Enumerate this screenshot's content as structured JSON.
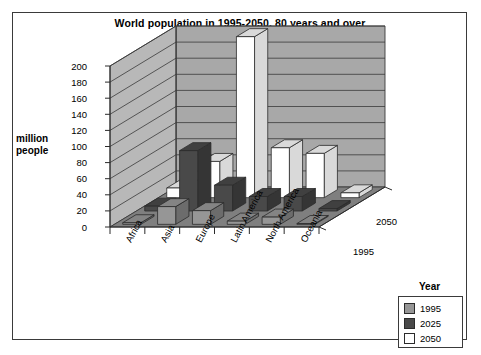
{
  "chart_data": {
    "type": "bar",
    "subtype": "3d-grouped-bar",
    "title": "World population in 1995-2050, 80 years and over",
    "xlabel": "",
    "ylabel": "million people",
    "zlabel": "Year",
    "categories": [
      "Africa",
      "Asia",
      "Europe",
      "Latin America",
      "North America",
      "Oceania"
    ],
    "series": [
      {
        "name": "1995",
        "color": "#969696",
        "values": [
          2,
          22,
          17,
          4,
          9,
          1
        ]
      },
      {
        "name": "2025",
        "color": "#494949",
        "values": [
          6,
          75,
          32,
          18,
          18,
          3
        ]
      },
      {
        "name": "2050",
        "color": "#ffffff",
        "values": [
          12,
          45,
          200,
          62,
          55,
          6
        ]
      }
    ],
    "yticks": [
      0,
      20,
      40,
      60,
      80,
      100,
      120,
      140,
      160,
      180,
      200
    ],
    "ylim": [
      0,
      200
    ],
    "ztick_labels": [
      "1995",
      "2050"
    ],
    "grid": true,
    "legend_position": "bottom-right",
    "legend_title": "Year"
  },
  "legend": {
    "title": "Year",
    "items": [
      {
        "label": "1995",
        "color": "#969696"
      },
      {
        "label": "2025",
        "color": "#494949"
      },
      {
        "label": "2050",
        "color": "#ffffff"
      }
    ]
  },
  "axis": {
    "y_caption_line1": "million",
    "y_caption_line2": "people",
    "depth_front": "1995",
    "depth_back": "2050"
  },
  "colors": {
    "back_wall": "#a8a8a8",
    "side_wall": "#b8b8b8",
    "floor": "#7f7f7f",
    "gridline": "#3a3a3a",
    "frame": "#3a3a3a",
    "series_1995": "#969696",
    "series_2025": "#494949",
    "series_2050": "#ffffff"
  }
}
